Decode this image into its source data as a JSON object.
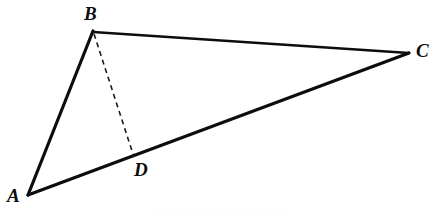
{
  "figure": {
    "kind": "geometry-diagram",
    "width": 432,
    "height": 220,
    "background_color": "#ffffff",
    "ink_color": "#0d0d0d"
  },
  "points": {
    "A": {
      "label": "A",
      "x": 28,
      "y": 195
    },
    "B": {
      "label": "B",
      "x": 93,
      "y": 31
    },
    "C": {
      "label": "C",
      "x": 409,
      "y": 53
    },
    "D": {
      "label": "D",
      "x": 134,
      "y": 158
    }
  },
  "labels": {
    "A": "A",
    "B": "B",
    "C": "C",
    "D": "D"
  },
  "segments": [
    {
      "name": "AB",
      "from": "A",
      "to": "B",
      "style": "solid",
      "stroke_width": 3.2,
      "color": "#0d0d0d"
    },
    {
      "name": "BC",
      "from": "B",
      "to": "C",
      "style": "solid",
      "stroke_width": 2.6,
      "color": "#0d0d0d"
    },
    {
      "name": "AC",
      "from": "A",
      "to": "C",
      "style": "solid",
      "stroke_width": 3.2,
      "color": "#0d0d0d"
    },
    {
      "name": "BD",
      "from": "B",
      "to": "D",
      "style": "dashed",
      "stroke_width": 1.6,
      "color": "#1a1a1a",
      "dash_pattern": "5 4"
    }
  ],
  "paths": {
    "AB": "M 28 195 L 93 31",
    "BC": "M 93 32 L 409 53",
    "AC": "M 28 195 L 409 53",
    "BD": "M 94 34 L 134 157"
  }
}
